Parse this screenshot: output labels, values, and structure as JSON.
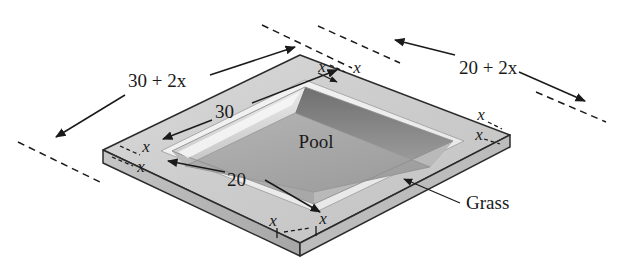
{
  "figure": {
    "regions": {
      "pool_label": "Pool",
      "grass_label": "Grass"
    },
    "dimensions": {
      "outer_long": "30 + 2x",
      "outer_short": "20 + 2x",
      "pool_long": "30",
      "pool_short": "20",
      "border_width": "x"
    },
    "corner_marks": {
      "top_left_of_top_edge": "x",
      "top_right_of_top_edge": "x",
      "left_upper": "x",
      "left_lower": "x",
      "right_upper": "x",
      "right_lower": "x",
      "bottom_left": "x",
      "bottom_right": "x"
    },
    "colors": {
      "grass_top": "#cfcfcf",
      "grass_side": "#b5b5b5",
      "pool_wall_dark": "#8e8e8e",
      "pool_wall_light": "#e8e8e8",
      "pool_floor": "#a9a9a9",
      "ink": "#1a1a1a",
      "background": "#ffffff"
    }
  }
}
